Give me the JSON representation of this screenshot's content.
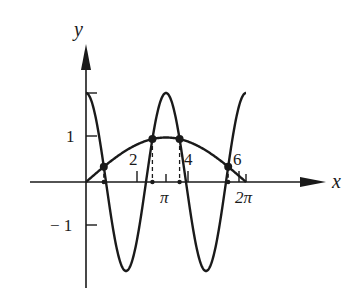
{
  "axes": {
    "x_label": "x",
    "y_label": "y",
    "y_ticks": [
      {
        "label": "1",
        "value": 1
      },
      {
        "label": "− 1",
        "value": -1
      }
    ],
    "x_ticks": [
      {
        "label": "2",
        "value": 2
      },
      {
        "label": "4",
        "value": 4
      },
      {
        "label": "6",
        "value": 6
      },
      {
        "label": "π",
        "value": 3.14159
      },
      {
        "label": "2π",
        "value": 6.28318
      }
    ]
  },
  "curves": [
    {
      "name": "oscillating-curve",
      "description": "y = 2cos(2x)",
      "amplitude": 2,
      "frequency": 2
    },
    {
      "name": "arch-curve",
      "description": "y = sin(x/2)",
      "amplitude": 1
    }
  ],
  "intersection_points": 4,
  "colors": {
    "ink": "#1a1a1a",
    "background": "#ffffff"
  }
}
